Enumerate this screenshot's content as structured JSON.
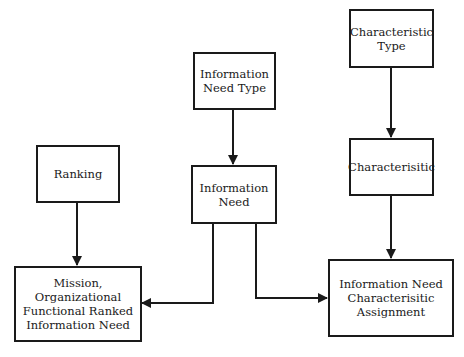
{
  "diagram": {
    "type": "flowchart",
    "nodes": [
      {
        "id": "characteristic-type",
        "label": "Characteristic\nType"
      },
      {
        "id": "information-need-type",
        "label": "Information\nNeed Type"
      },
      {
        "id": "ranking",
        "label": "Ranking"
      },
      {
        "id": "information-need",
        "label": "Information\nNeed"
      },
      {
        "id": "characterisitic",
        "label": "Characterisitic"
      },
      {
        "id": "mission-ranked-need",
        "label": "Mission,\nOrganizational\nFunctional Ranked\nInformation Need"
      },
      {
        "id": "need-characteristic-assignment",
        "label": "Information Need\nCharacterisitic\nAssignment"
      }
    ],
    "edges": [
      {
        "from": "characteristic-type",
        "to": "characterisitic"
      },
      {
        "from": "characterisitic",
        "to": "need-characteristic-assignment"
      },
      {
        "from": "information-need-type",
        "to": "information-need"
      },
      {
        "from": "ranking",
        "to": "mission-ranked-need"
      },
      {
        "from": "information-need",
        "to": "mission-ranked-need"
      },
      {
        "from": "information-need",
        "to": "need-characteristic-assignment"
      }
    ],
    "colors": {
      "stroke": "#1a1a1a",
      "background": "#ffffff"
    }
  }
}
